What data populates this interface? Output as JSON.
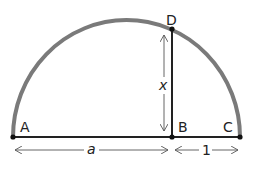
{
  "diagram": {
    "points": {
      "A": {
        "label": "A"
      },
      "B": {
        "label": "B"
      },
      "C": {
        "label": "C"
      },
      "D": {
        "label": "D"
      }
    },
    "measures": {
      "AB": "a",
      "BC": "1",
      "BD": "x"
    },
    "colors": {
      "arc": "#7a7a7a",
      "line": "#222222",
      "arrow": "#555555",
      "background": "#ffffff"
    }
  }
}
